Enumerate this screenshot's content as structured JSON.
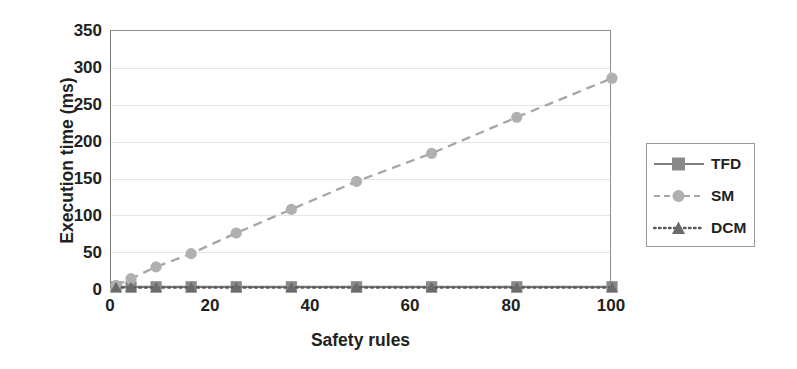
{
  "chart_data": {
    "type": "line",
    "title": "",
    "xlabel": "Safety rules",
    "ylabel": "Execution time (ms)",
    "xlim": [
      0,
      100
    ],
    "ylim": [
      0,
      350
    ],
    "xticks": [
      0,
      20,
      40,
      60,
      80,
      100
    ],
    "yticks": [
      0,
      50,
      100,
      150,
      200,
      250,
      300,
      350
    ],
    "grid": "horizontal",
    "legend_position": "right-outside",
    "x": [
      1,
      4,
      9,
      16,
      25,
      36,
      49,
      64,
      81,
      100
    ],
    "series": [
      {
        "name": "TFD",
        "marker": "square",
        "linestyle": "solid",
        "color": "#808080",
        "values": [
          3,
          3,
          3,
          3,
          3,
          3,
          3,
          3,
          3,
          3
        ]
      },
      {
        "name": "SM",
        "marker": "circle",
        "linestyle": "dashed",
        "color": "#a6a6a6",
        "values": [
          5,
          14,
          30,
          48,
          76,
          108,
          146,
          184,
          233,
          286
        ]
      },
      {
        "name": "DCM",
        "marker": "triangle",
        "linestyle": "dotted",
        "color": "#595959",
        "values": [
          2,
          2,
          2,
          2,
          2,
          2,
          2,
          2,
          2,
          2
        ]
      }
    ]
  },
  "axes": {
    "ytick_labels": [
      "350",
      "300",
      "250",
      "200",
      "150",
      "100",
      "50",
      "0"
    ],
    "xtick_labels": [
      "0",
      "20",
      "40",
      "60",
      "80",
      "100"
    ],
    "y_axis_title": "Execution time (ms)",
    "x_axis_title": "Safety rules"
  },
  "legend": {
    "items": [
      {
        "label": "TFD"
      },
      {
        "label": "SM"
      },
      {
        "label": "DCM"
      }
    ]
  },
  "colors": {
    "tfd": "#808080",
    "sm": "#a6a6a6",
    "dcm": "#595959",
    "axis": "#7d7d7d",
    "grid": "#e3e7ec",
    "text": "#231f20",
    "background": "#ffffff"
  }
}
